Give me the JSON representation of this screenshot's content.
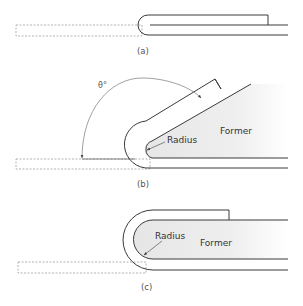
{
  "panels": [
    {
      "id": "a",
      "caption": "(a)"
    },
    {
      "id": "b",
      "caption": "(b)",
      "angle_label": "θ°",
      "radius_label": "Radius",
      "former_label": "Former"
    },
    {
      "id": "c",
      "caption": "(c)",
      "radius_label": "Radius",
      "former_label": "Former"
    }
  ],
  "colors": {
    "line": "#3a3a3a",
    "dashed": "#9a9a9a",
    "former_fill": "#ececec",
    "annotation": "#555555"
  }
}
